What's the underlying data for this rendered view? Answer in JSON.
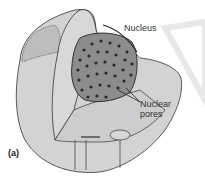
{
  "figure": {
    "panel_label": "(a)",
    "labels": {
      "nucleus": "Nucleus",
      "nuclear_pores_line1": "Nuclear",
      "nuclear_pores_line2": "pores"
    },
    "colors": {
      "cell_fill": "#d2d2d2",
      "cut_face": "#cacaca",
      "nucleus_fill": "#8a8a8a",
      "pore": "#2a2a2a",
      "outline": "#333333",
      "watermark": "#e6e6e6"
    }
  }
}
